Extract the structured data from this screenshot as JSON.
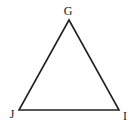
{
  "diagram": {
    "type": "triangle",
    "shape": "equilateral",
    "vertices": [
      {
        "id": "apex",
        "label": "G"
      },
      {
        "id": "bottom-left",
        "label": "J"
      },
      {
        "id": "bottom-right",
        "label": "I"
      }
    ],
    "edges": [
      {
        "from": "G",
        "to": "J"
      },
      {
        "from": "J",
        "to": "I"
      },
      {
        "from": "I",
        "to": "G"
      }
    ],
    "stroke_color": "#222222",
    "label_color": "#222222",
    "background_color": "#ffffff"
  }
}
